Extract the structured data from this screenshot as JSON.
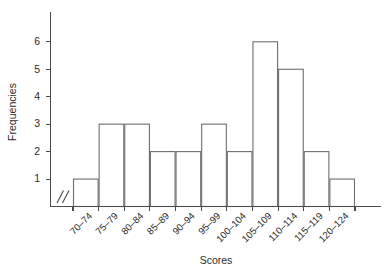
{
  "chart_data": {
    "type": "bar",
    "title": "",
    "subtitle": "",
    "xlabel": "Scores",
    "ylabel": "Frequencies",
    "categories": [
      "70–74",
      "75–79",
      "80–84",
      "85–89",
      "90–94",
      "95–99",
      "100–104",
      "105–109",
      "110–114",
      "115–119",
      "120–124"
    ],
    "values": [
      1,
      3,
      3,
      2,
      2,
      3,
      2,
      6,
      5,
      2,
      1
    ],
    "ylim": [
      0,
      6.6
    ],
    "yticks": [
      1,
      2,
      3,
      4,
      5,
      6
    ],
    "ytick_labels": [
      "1",
      "2",
      "3",
      "4",
      "5",
      "6"
    ],
    "grid": false,
    "legend": null,
    "axis_break": "//",
    "bar_style": {
      "fill": "#ffffff",
      "edge": "#6d6d6d"
    },
    "axis_color": "#4a4a4a",
    "total_frequency": 30
  }
}
